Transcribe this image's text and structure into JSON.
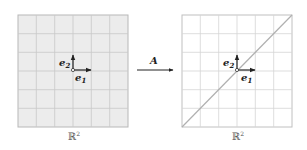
{
  "diagram": {
    "left_panel": {
      "label": "ℝ",
      "label_sup": "2",
      "basis": {
        "e1": "e",
        "e1_sub": "1",
        "e2": "e",
        "e2_sub": "2"
      },
      "fill": "#ececec",
      "grid_color": "#c4c4c4",
      "grid_divisions": 6
    },
    "map": {
      "label": "A"
    },
    "right_panel": {
      "label": "ℝ",
      "label_sup": "2",
      "basis": {
        "e1": "e",
        "e1_sub": "1",
        "e2": "e",
        "e2_sub": "2"
      },
      "fill": "#ffffff",
      "grid_color": "#d2d2d2",
      "grid_divisions": 6,
      "image_line": "diagonal y = x"
    }
  }
}
